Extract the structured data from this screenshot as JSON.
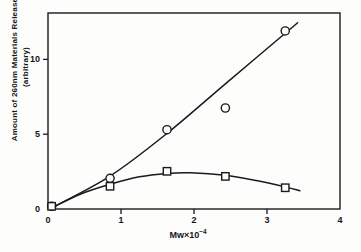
{
  "chart_data": {
    "type": "scatter",
    "title": "",
    "xlabel": "Mw×10⁻⁴",
    "ylabel": "Amount of 260nm Materials Released (arbitrary)",
    "ylabel_line1": "Amount of 260nm Materials Released",
    "ylabel_line2": "(arbitrary)",
    "xlabel_base": "Mw×10",
    "xlabel_exponent": "−4",
    "xlim": [
      0,
      4
    ],
    "ylim": [
      0,
      13.1
    ],
    "xticks": [
      0,
      1,
      2,
      3,
      4
    ],
    "xtick_labels": [
      "0",
      "1",
      "2",
      "3",
      "4"
    ],
    "yticks": [
      0,
      5,
      10
    ],
    "ytick_labels": [
      "0",
      "5",
      "10"
    ],
    "grid": false,
    "legend": "none",
    "frame": "box",
    "tick_direction": "out",
    "series": [
      {
        "name": "circle-series",
        "marker": "circle",
        "marker_filled": false,
        "points": [
          {
            "x": 0.05,
            "y": 0.18
          },
          {
            "x": 0.85,
            "y": 2.05
          },
          {
            "x": 1.63,
            "y": 5.3
          },
          {
            "x": 2.43,
            "y": 6.75
          },
          {
            "x": 3.25,
            "y": 11.9
          }
        ],
        "fit_line": [
          {
            "x": 0.04,
            "y": 0.05
          },
          {
            "x": 0.85,
            "y": 2.2
          },
          {
            "x": 1.63,
            "y": 5.05
          },
          {
            "x": 2.45,
            "y": 8.45
          },
          {
            "x": 3.42,
            "y": 12.45
          }
        ]
      },
      {
        "name": "square-series",
        "marker": "square",
        "marker_filled": false,
        "points": [
          {
            "x": 0.05,
            "y": 0.18
          },
          {
            "x": 0.85,
            "y": 1.52
          },
          {
            "x": 1.63,
            "y": 2.52
          },
          {
            "x": 2.43,
            "y": 2.18
          },
          {
            "x": 3.25,
            "y": 1.42
          }
        ],
        "fit_line": [
          {
            "x": 0.04,
            "y": 0.05
          },
          {
            "x": 0.45,
            "y": 1.0
          },
          {
            "x": 0.85,
            "y": 1.65
          },
          {
            "x": 1.25,
            "y": 2.15
          },
          {
            "x": 1.63,
            "y": 2.38
          },
          {
            "x": 1.95,
            "y": 2.42
          },
          {
            "x": 2.43,
            "y": 2.25
          },
          {
            "x": 2.85,
            "y": 1.9
          },
          {
            "x": 3.25,
            "y": 1.48
          },
          {
            "x": 3.45,
            "y": 1.22
          }
        ]
      }
    ]
  },
  "plot_geometry": {
    "left_px": 48,
    "right_px": 340,
    "top_px": 13,
    "bottom_px": 209
  },
  "style": {
    "line_color": "#1a1a1f",
    "axis_color": "#1a1a1f",
    "background": "#fdfdfb"
  }
}
